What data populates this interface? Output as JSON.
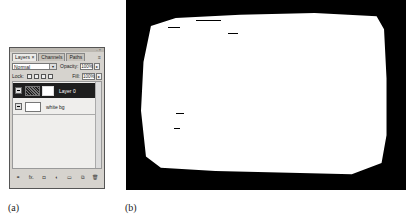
{
  "layers_panel": {
    "tabs": [
      {
        "label": "Layers ×",
        "active": true
      },
      {
        "label": "Channels",
        "active": false
      },
      {
        "label": "Paths",
        "active": false
      }
    ],
    "close_glyph": "- ×",
    "menu_glyph": "≡",
    "blend_mode": "Normal",
    "opacity_label": "Opacity:",
    "opacity_value": "100%",
    "lock_label": "Lock:",
    "fill_label": "Fill:",
    "fill_value": "100%",
    "stepper_glyph": "▸",
    "dropdown_glyph": "▾",
    "layers": [
      {
        "name": "Layer 0",
        "selected": true
      },
      {
        "name": "white bg",
        "selected": false
      }
    ],
    "footer_icons": [
      "link-icon",
      "fx-icon",
      "mask-icon",
      "adjustment-icon",
      "group-icon",
      "new-layer-icon",
      "trash-icon"
    ],
    "footer_glyphs": [
      "⚭",
      "fx.",
      "◘",
      "◐",
      "▭",
      "⧉",
      "🗑"
    ]
  },
  "captions": {
    "a": "(a)",
    "b": "(b)"
  },
  "image_b": {
    "description": "black grunge border frame with white center",
    "background_color": "#000000",
    "center_color": "#ffffff"
  }
}
